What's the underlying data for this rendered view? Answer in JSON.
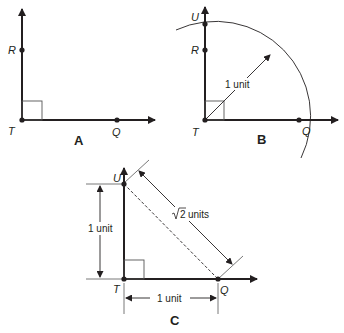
{
  "figure": {
    "panels": [
      {
        "id": "A",
        "caption": "A",
        "points": {
          "T": "T",
          "R": "R",
          "Q": "Q"
        }
      },
      {
        "id": "B",
        "caption": "B",
        "points": {
          "T": "T",
          "R": "R",
          "U": "U",
          "Q": "Q"
        },
        "radius_label": "1 unit"
      },
      {
        "id": "C",
        "caption": "C",
        "points": {
          "T": "T",
          "U": "U",
          "Q": "Q"
        },
        "vertical_label": "1 unit",
        "horizontal_label": "1 unit",
        "hypotenuse_label_root": "2",
        "hypotenuse_label_units": "units"
      }
    ],
    "colors": {
      "stroke": "#231f20",
      "light": "#555555"
    }
  }
}
